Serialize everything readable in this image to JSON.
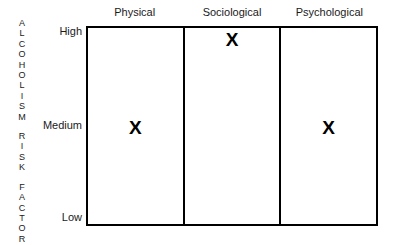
{
  "chart_data": {
    "type": "table",
    "title": "",
    "ylabel": "ALCOHOLISM RISK FACTOR",
    "xlabel": "",
    "categories": [
      "Physical",
      "Sociological",
      "Psychological"
    ],
    "levels": [
      "High",
      "Medium",
      "Low"
    ],
    "marker_glyph": "X",
    "values": [
      {
        "category": "Physical",
        "level": "Medium"
      },
      {
        "category": "Sociological",
        "level": "High"
      },
      {
        "category": "Psychological",
        "level": "Medium"
      }
    ],
    "grid": false,
    "legend": "none",
    "colors": {
      "border": "#000000",
      "text": "#1a1a1a",
      "marker": "#000000",
      "background": "#ffffff"
    }
  },
  "axis_title": {
    "words": [
      {
        "letters": [
          "A",
          "L",
          "C",
          "O",
          "H",
          "O",
          "L",
          "I",
          "S",
          "M"
        ]
      },
      {
        "letters": [
          "R",
          "I",
          "S",
          "K"
        ]
      },
      {
        "letters": [
          "F",
          "A",
          "C",
          "T",
          "O",
          "R"
        ]
      }
    ]
  },
  "y_ticks": {
    "high": "High",
    "medium": "Medium",
    "low": "Low"
  },
  "columns": [
    {
      "header": "Physical",
      "marker": "X",
      "level": "Medium"
    },
    {
      "header": "Sociological",
      "marker": "X",
      "level": "High"
    },
    {
      "header": "Psychological",
      "marker": "X",
      "level": "Medium"
    }
  ]
}
